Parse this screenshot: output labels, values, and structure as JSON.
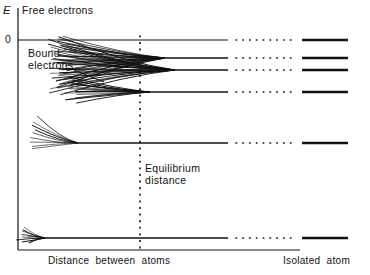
{
  "figure": {
    "axis_label_energy": "E",
    "origin_tick": "0",
    "region_free": "Free electrons",
    "region_bound": "Bound\nelectrons",
    "marker_equilibrium": "Equilibrium\ndistance",
    "axis_label_x": "Distance  between  atoms",
    "axis_label_right": "Isolated  atom",
    "line_color": "#111111",
    "background_color": "#ffffff"
  },
  "chart_data": {
    "type": "line",
    "xlabel": "Distance  between  atoms",
    "ylabel": "E",
    "grid": false,
    "legend": null,
    "axes": {
      "y_axis_x_px": 18,
      "y_axis_top_px": 8,
      "x_axis_y_px": 250,
      "x_axis_left_px": 18,
      "x_axis_right_px": 300,
      "zero_level_y_px": 40,
      "zero_level_label": "0",
      "equilibrium_line_x_px": 140,
      "equilibrium_dash_top_px": 36,
      "equilibrium_dash_bottom_px": 250
    },
    "annotations": [
      {
        "text": "Free electrons",
        "x_px": 22,
        "y_px": 4,
        "role": "region-above-zero"
      },
      {
        "text": "Bound electrons",
        "x_px": 28,
        "y_px": 48,
        "role": "region-below-zero"
      },
      {
        "text": "Equilibrium distance",
        "x_px": 144,
        "y_px": 168,
        "role": "vertical-marker"
      },
      {
        "text": "Distance  between  atoms",
        "x_px": 48,
        "y_px": 256,
        "role": "x-axis-title"
      },
      {
        "text": "Isolated  atom",
        "x_px": 286,
        "y_px": 256,
        "role": "right-axis-title"
      }
    ],
    "levels": [
      {
        "name": "zero-reference",
        "y_px": 40,
        "kind": "reference-line",
        "solid_from_x_px": 18,
        "solid_to_x_px": 228,
        "dotted_from_x_px": 236,
        "dotted_to_x_px": 292,
        "isolated_bar_from_x_px": 302,
        "isolated_bar_to_x_px": 348,
        "band_lines": 0,
        "converge_x_px": null,
        "band_left_x_px": null,
        "band_spread_up_px": 0,
        "band_spread_down_px": 0
      },
      {
        "name": "band-upper-1",
        "y_px": 58,
        "kind": "split-band",
        "solid_from_x_px": 165,
        "solid_to_x_px": 228,
        "dotted_from_x_px": 236,
        "dotted_to_x_px": 292,
        "isolated_bar_from_x_px": 302,
        "isolated_bar_to_x_px": 348,
        "band_lines": 26,
        "converge_x_px": 165,
        "band_left_x_px": 62,
        "band_spread_up_px": 22,
        "band_spread_down_px": 30
      },
      {
        "name": "band-upper-2",
        "y_px": 70,
        "kind": "split-band",
        "solid_from_x_px": 175,
        "solid_to_x_px": 228,
        "dotted_from_x_px": 236,
        "dotted_to_x_px": 292,
        "isolated_bar_from_x_px": 302,
        "isolated_bar_to_x_px": 348,
        "band_lines": 24,
        "converge_x_px": 175,
        "band_left_x_px": 55,
        "band_spread_up_px": 32,
        "band_spread_down_px": 24
      },
      {
        "name": "band-middle",
        "y_px": 92,
        "kind": "split-band",
        "solid_from_x_px": 150,
        "solid_to_x_px": 228,
        "dotted_from_x_px": 236,
        "dotted_to_x_px": 292,
        "isolated_bar_from_x_px": 302,
        "isolated_bar_to_x_px": 348,
        "band_lines": 16,
        "converge_x_px": 150,
        "band_left_x_px": 70,
        "band_spread_up_px": 14,
        "band_spread_down_px": 10
      },
      {
        "name": "level-lower",
        "y_px": 143,
        "kind": "split-band",
        "solid_from_x_px": 78,
        "solid_to_x_px": 228,
        "dotted_from_x_px": 236,
        "dotted_to_x_px": 292,
        "isolated_bar_from_x_px": 302,
        "isolated_bar_to_x_px": 348,
        "band_lines": 9,
        "converge_x_px": 78,
        "band_left_x_px": 32,
        "band_spread_up_px": 26,
        "band_spread_down_px": 6
      },
      {
        "name": "level-core",
        "y_px": 238,
        "kind": "split-band",
        "solid_from_x_px": 45,
        "solid_to_x_px": 228,
        "dotted_from_x_px": 236,
        "dotted_to_x_px": 292,
        "isolated_bar_from_x_px": 302,
        "isolated_bar_to_x_px": 348,
        "band_lines": 9,
        "converge_x_px": 45,
        "band_left_x_px": 22,
        "band_spread_up_px": 11,
        "band_spread_down_px": 5
      }
    ],
    "pointer_bound_electrons": {
      "x1_px": 74,
      "y1_px": 70,
      "x2_px": 104,
      "y2_px": 82
    }
  }
}
